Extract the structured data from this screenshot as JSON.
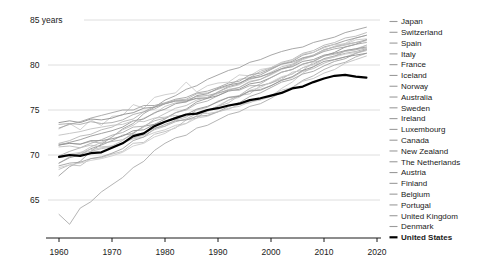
{
  "chart_data": {
    "type": "line",
    "title": "",
    "xlabel": "",
    "ylabel": "years",
    "grid": true,
    "legend_position": "right",
    "xlim": [
      1960,
      2020
    ],
    "ylim": [
      61,
      85
    ],
    "y_ticks": [
      {
        "v": 85,
        "label": "85 years"
      },
      {
        "v": 80,
        "label": "80"
      },
      {
        "v": 75,
        "label": "75"
      },
      {
        "v": 70,
        "label": "70"
      },
      {
        "v": 65,
        "label": "65"
      }
    ],
    "x_ticks": [
      {
        "v": 1960,
        "label": "1960"
      },
      {
        "v": 1970,
        "label": "1970"
      },
      {
        "v": 1980,
        "label": "1980"
      },
      {
        "v": 1990,
        "label": "1990"
      },
      {
        "v": 2000,
        "label": "2000"
      },
      {
        "v": 2010,
        "label": "2010"
      },
      {
        "v": 2020,
        "label": "2020"
      }
    ],
    "x": [
      1960,
      1962,
      1964,
      1966,
      1968,
      1970,
      1972,
      1974,
      1976,
      1978,
      1980,
      1982,
      1984,
      1986,
      1988,
      1990,
      1992,
      1994,
      1996,
      1998,
      2000,
      2002,
      2004,
      2006,
      2008,
      2010,
      2012,
      2014,
      2016,
      2018
    ],
    "series": [
      {
        "name": "Japan",
        "color": "#9e9e9e",
        "bold": false,
        "values": [
          67.7,
          68.7,
          69.3,
          70.4,
          71.2,
          72.0,
          72.9,
          73.5,
          74.6,
          75.3,
          76.1,
          76.6,
          77.3,
          77.7,
          78.4,
          78.9,
          79.4,
          79.7,
          80.3,
          80.6,
          81.1,
          81.5,
          81.8,
          82.0,
          82.5,
          82.8,
          83.1,
          83.6,
          83.9,
          84.2
        ]
      },
      {
        "name": "Switzerland",
        "color": "#b6b6b6",
        "bold": false,
        "values": [
          71.3,
          71.6,
          72.1,
          72.3,
          72.8,
          73.1,
          73.7,
          74.0,
          74.8,
          75.1,
          75.7,
          76.1,
          76.2,
          76.8,
          76.9,
          77.3,
          77.7,
          78.4,
          78.6,
          79.3,
          79.7,
          80.3,
          80.6,
          81.3,
          81.6,
          82.2,
          82.5,
          83.0,
          83.2,
          83.6
        ]
      },
      {
        "name": "Spain",
        "color": "#c3c3c3",
        "bold": false,
        "values": [
          69.1,
          69.8,
          70.2,
          70.9,
          71.4,
          72.0,
          72.8,
          73.3,
          74.1,
          74.6,
          75.4,
          75.8,
          75.9,
          76.3,
          76.4,
          76.8,
          77.3,
          77.5,
          78.2,
          78.4,
          78.9,
          79.5,
          79.9,
          80.6,
          81.0,
          81.6,
          82.1,
          82.4,
          83.0,
          83.3
        ]
      },
      {
        "name": "Italy",
        "color": "#999999",
        "bold": false,
        "values": [
          69.1,
          69.7,
          70.0,
          70.7,
          71.1,
          71.6,
          72.2,
          72.4,
          73.2,
          73.4,
          74.0,
          74.7,
          75.1,
          75.9,
          76.3,
          77.0,
          77.6,
          77.9,
          78.6,
          78.9,
          79.5,
          80.1,
          80.4,
          81.1,
          81.4,
          82.0,
          82.3,
          82.7,
          83.0,
          83.3
        ]
      },
      {
        "name": "France",
        "color": "#aeaeae",
        "bold": false,
        "values": [
          69.9,
          70.4,
          70.8,
          71.3,
          71.7,
          72.2,
          72.5,
          73.1,
          73.2,
          73.8,
          74.1,
          74.7,
          75.0,
          75.7,
          76.0,
          76.6,
          77.2,
          77.5,
          78.1,
          78.4,
          79.0,
          79.6,
          80.0,
          80.7,
          81.1,
          81.7,
          82.0,
          82.3,
          82.5,
          82.8
        ]
      },
      {
        "name": "Iceland",
        "color": "#c9c9c9",
        "bold": false,
        "values": [
          72.9,
          73.5,
          72.8,
          73.9,
          73.3,
          74.3,
          74.4,
          75.6,
          75.2,
          76.4,
          76.7,
          76.9,
          78.1,
          77.0,
          77.7,
          78.0,
          78.1,
          78.9,
          78.8,
          79.5,
          79.7,
          80.2,
          80.5,
          81.2,
          81.4,
          81.9,
          82.3,
          82.3,
          82.8,
          82.9
        ]
      },
      {
        "name": "Norway",
        "color": "#8f8f8f",
        "bold": false,
        "values": [
          73.6,
          73.8,
          73.6,
          74.0,
          73.9,
          74.1,
          74.5,
          74.7,
          75.2,
          75.3,
          75.7,
          76.0,
          76.0,
          76.3,
          76.3,
          76.6,
          77.1,
          77.3,
          77.9,
          78.1,
          78.6,
          79.2,
          79.5,
          80.1,
          80.4,
          81.0,
          81.4,
          82.0,
          82.3,
          82.8
        ]
      },
      {
        "name": "Australia",
        "color": "#bcbcbc",
        "bold": false,
        "values": [
          70.9,
          71.0,
          70.8,
          71.1,
          70.9,
          71.0,
          71.6,
          72.5,
          73.1,
          74.0,
          74.6,
          75.2,
          75.5,
          76.1,
          76.4,
          77.0,
          77.5,
          77.8,
          78.4,
          78.7,
          79.2,
          79.8,
          80.1,
          80.8,
          81.1,
          81.7,
          82.0,
          82.2,
          82.5,
          82.7
        ]
      },
      {
        "name": "Sweden",
        "color": "#a4a4a4",
        "bold": false,
        "values": [
          73.0,
          73.4,
          73.7,
          74.1,
          74.4,
          74.7,
          75.0,
          75.0,
          75.5,
          75.5,
          75.8,
          76.2,
          76.4,
          76.9,
          77.1,
          77.5,
          78.0,
          78.2,
          78.9,
          79.1,
          79.6,
          80.1,
          80.3,
          80.8,
          81.0,
          81.5,
          81.8,
          82.0,
          82.3,
          82.5
        ]
      },
      {
        "name": "Ireland",
        "color": "#c6c6c6",
        "bold": false,
        "values": [
          69.9,
          70.1,
          70.3,
          70.6,
          70.8,
          71.0,
          71.3,
          71.8,
          72.0,
          72.5,
          72.8,
          73.3,
          73.5,
          74.1,
          74.3,
          74.8,
          75.2,
          75.4,
          75.9,
          76.1,
          76.5,
          77.4,
          78.1,
          79.1,
          79.8,
          80.7,
          81.0,
          81.6,
          81.8,
          82.2
        ]
      },
      {
        "name": "Luxembourg",
        "color": "#bdbdbd",
        "bold": false,
        "values": [
          68.4,
          68.9,
          68.8,
          69.6,
          69.7,
          70.1,
          70.4,
          71.3,
          71.4,
          72.3,
          72.6,
          73.0,
          73.9,
          74.1,
          75.0,
          75.4,
          75.8,
          76.6,
          76.8,
          77.7,
          78.0,
          78.4,
          79.2,
          79.4,
          80.3,
          80.6,
          80.9,
          81.6,
          81.7,
          82.2
        ]
      },
      {
        "name": "Canada",
        "color": "#969696",
        "bold": false,
        "values": [
          71.1,
          71.4,
          71.7,
          72.1,
          72.4,
          72.7,
          73.1,
          73.8,
          74.0,
          74.7,
          75.1,
          75.7,
          75.9,
          76.6,
          76.8,
          77.4,
          77.8,
          78.0,
          78.5,
          78.7,
          79.1,
          79.6,
          79.8,
          80.4,
          80.6,
          81.1,
          81.3,
          81.6,
          81.8,
          82.0
        ]
      },
      {
        "name": "New Zealand",
        "color": "#b1b1b1",
        "bold": false,
        "values": [
          71.2,
          71.3,
          71.2,
          71.5,
          71.3,
          71.5,
          71.7,
          72.3,
          72.4,
          73.0,
          73.2,
          73.7,
          74.0,
          74.6,
          74.9,
          75.4,
          76.1,
          76.6,
          77.4,
          77.9,
          78.6,
          79.2,
          79.5,
          80.1,
          80.4,
          81.0,
          81.2,
          81.5,
          81.7,
          81.9
        ]
      },
      {
        "name": "The Netherlands",
        "color": "#a9a9a9",
        "bold": false,
        "values": [
          73.4,
          73.5,
          73.4,
          73.7,
          73.5,
          73.6,
          73.9,
          74.5,
          74.8,
          75.4,
          75.7,
          76.0,
          76.1,
          76.5,
          76.6,
          76.9,
          77.2,
          77.2,
          77.7,
          77.7,
          78.0,
          78.6,
          79.0,
          79.7,
          80.1,
          80.7,
          81.0,
          81.3,
          81.5,
          81.8
        ]
      },
      {
        "name": "Austria",
        "color": "#cccccc",
        "bold": false,
        "values": [
          68.6,
          68.9,
          69.1,
          69.4,
          69.6,
          69.9,
          70.3,
          71.0,
          71.3,
          72.0,
          72.4,
          73.1,
          73.5,
          74.4,
          74.8,
          75.5,
          76.1,
          76.4,
          77.2,
          77.5,
          78.1,
          78.7,
          79.0,
          79.7,
          80.0,
          80.6,
          80.9,
          81.2,
          81.4,
          81.7
        ]
      },
      {
        "name": "Finland",
        "color": "#a1a1a1",
        "bold": false,
        "values": [
          68.8,
          69.1,
          69.2,
          69.6,
          69.8,
          70.2,
          70.7,
          71.6,
          72.0,
          72.9,
          73.4,
          73.8,
          73.9,
          74.3,
          74.4,
          74.8,
          75.4,
          75.8,
          76.5,
          76.9,
          77.5,
          78.1,
          78.4,
          79.0,
          79.3,
          79.9,
          80.4,
          80.7,
          81.3,
          81.7
        ]
      },
      {
        "name": "Belgium",
        "color": "#b9b9b9",
        "bold": false,
        "values": [
          69.7,
          69.9,
          70.2,
          70.4,
          70.7,
          70.9,
          71.3,
          71.9,
          72.2,
          72.8,
          73.2,
          73.9,
          74.2,
          75.0,
          75.3,
          76.0,
          76.4,
          76.6,
          77.1,
          77.3,
          77.7,
          78.3,
          78.6,
          79.3,
          79.6,
          80.2,
          80.6,
          80.9,
          81.3,
          81.6
        ]
      },
      {
        "name": "Portugal",
        "color": "#ababab",
        "bold": false,
        "values": [
          63.4,
          62.3,
          64.1,
          64.8,
          65.9,
          66.7,
          67.5,
          68.6,
          69.3,
          70.5,
          71.3,
          71.9,
          72.2,
          73.0,
          73.3,
          73.9,
          74.5,
          74.8,
          75.4,
          75.7,
          76.3,
          77.0,
          77.5,
          78.3,
          78.8,
          79.5,
          80.0,
          80.3,
          80.9,
          81.3
        ]
      },
      {
        "name": "United Kingdom",
        "color": "#919191",
        "bold": false,
        "values": [
          71.1,
          71.3,
          71.2,
          71.6,
          71.6,
          71.8,
          72.1,
          72.7,
          72.8,
          73.4,
          73.7,
          74.2,
          74.5,
          75.1,
          75.4,
          75.9,
          76.4,
          76.5,
          77.1,
          77.2,
          77.7,
          78.3,
          78.7,
          79.4,
          79.8,
          80.4,
          80.6,
          80.9,
          81.1,
          81.3
        ]
      },
      {
        "name": "Denmark",
        "color": "#c1c1c1",
        "bold": false,
        "values": [
          72.2,
          72.4,
          72.6,
          72.9,
          73.1,
          73.3,
          73.4,
          73.8,
          73.7,
          74.1,
          74.2,
          74.4,
          74.3,
          74.7,
          74.6,
          74.8,
          75.1,
          75.6,
          75.8,
          76.3,
          76.6,
          77.2,
          77.5,
          78.2,
          78.5,
          79.1,
          79.5,
          80.2,
          80.6,
          81.0
        ]
      },
      {
        "name": "United States",
        "color": "#000000",
        "bold": true,
        "values": [
          69.8,
          70.0,
          69.9,
          70.2,
          70.3,
          70.8,
          71.3,
          72.1,
          72.4,
          73.2,
          73.7,
          74.1,
          74.5,
          74.6,
          75.0,
          75.2,
          75.5,
          75.7,
          76.1,
          76.3,
          76.6,
          76.9,
          77.4,
          77.6,
          78.1,
          78.5,
          78.8,
          78.9,
          78.7,
          78.6
        ]
      }
    ]
  },
  "colors": {
    "background": "#ffffff",
    "grid": "#d6d6d6",
    "axis": "#1a1a1a",
    "text": "#1a1a1a",
    "legend_dash": "#9b9b9b",
    "us_line": "#000000"
  }
}
